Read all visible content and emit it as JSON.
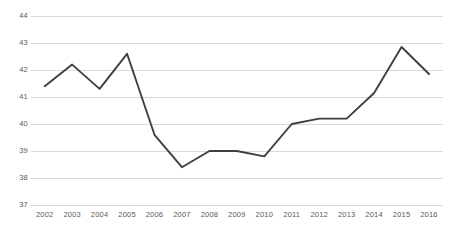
{
  "chart_data": {
    "type": "line",
    "title": "",
    "subtitle": "",
    "xlabel": "",
    "ylabel": "",
    "categories": [
      "2002",
      "2003",
      "2004",
      "2005",
      "2006",
      "2007",
      "2008",
      "2009",
      "2010",
      "2011",
      "2012",
      "2013",
      "2014",
      "2015",
      "2016"
    ],
    "series": [
      {
        "name": "",
        "values": [
          41.4,
          42.2,
          41.3,
          42.6,
          39.6,
          38.4,
          39.0,
          39.0,
          38.8,
          40.0,
          40.2,
          40.2,
          41.15,
          42.85,
          41.85
        ]
      }
    ],
    "ylim": [
      37,
      44
    ],
    "yticks": [
      37,
      38,
      39,
      40,
      41,
      42,
      43,
      44
    ],
    "ytick_labels": [
      "37",
      "38",
      "39",
      "40",
      "41",
      "42",
      "43",
      "44"
    ],
    "xtick_labels": [
      "2002",
      "2003",
      "2004",
      "2005",
      "2006",
      "2007",
      "2008",
      "2009",
      "2010",
      "2011",
      "2012",
      "2013",
      "2014",
      "2015",
      "2016"
    ],
    "grid": true,
    "grid_axis": "y",
    "legend": false,
    "legend_position": "none",
    "annotations": [],
    "colors": {
      "line": "#3f3f3f",
      "grid": "#d9d9d9",
      "tick_text": "#595959",
      "background": "#ffffff"
    }
  }
}
